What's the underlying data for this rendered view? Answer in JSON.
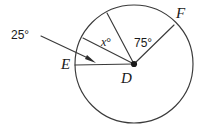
{
  "figure": {
    "type": "geometry-diagram",
    "background_color": "#ffffff",
    "stroke_color": "#3a3a3a",
    "text_color": "#1a1a1a",
    "canvas": {
      "width": 210,
      "height": 128
    },
    "circle": {
      "center_label": "D",
      "center_x": 134,
      "center_y": 64,
      "radius": 59
    },
    "points": [
      {
        "name": "point-E",
        "label": "E",
        "x": 75,
        "y": 65
      },
      {
        "name": "point-D",
        "label": "D",
        "x": 134,
        "y": 64
      },
      {
        "name": "point-F",
        "label": "F",
        "x": 172,
        "y": 27
      }
    ],
    "radii": [
      {
        "name": "radius-DE",
        "from": "D",
        "to": "E",
        "x1": 134,
        "y1": 64,
        "x2": 75,
        "y2": 65
      },
      {
        "name": "radius-DF",
        "from": "D",
        "to": "F",
        "x1": 134,
        "y1": 64,
        "x2": 174,
        "y2": 25
      },
      {
        "name": "radius-D-upper-left",
        "from": "D",
        "to": "arc",
        "x1": 134,
        "y1": 64,
        "x2": 107,
        "y2": 13
      },
      {
        "name": "radius-D-mid-left",
        "from": "D",
        "to": "arc",
        "x1": 134,
        "y1": 64,
        "x2": 83,
        "y2": 38
      }
    ],
    "angles": [
      {
        "name": "angle-25",
        "label": "25°",
        "value": 25,
        "unit": "degrees",
        "has_leader_arrow": true
      },
      {
        "name": "angle-x",
        "label_var": "x",
        "label_degree": "°",
        "value": "x",
        "unit": "degrees"
      },
      {
        "name": "angle-75",
        "label": "75°",
        "value": 75,
        "unit": "degrees"
      }
    ],
    "leader": {
      "name": "leader-line-25",
      "x1": 41,
      "y1": 36,
      "x2": 95,
      "y2": 62,
      "arrow_tip_x": 95,
      "arrow_tip_y": 62
    }
  }
}
